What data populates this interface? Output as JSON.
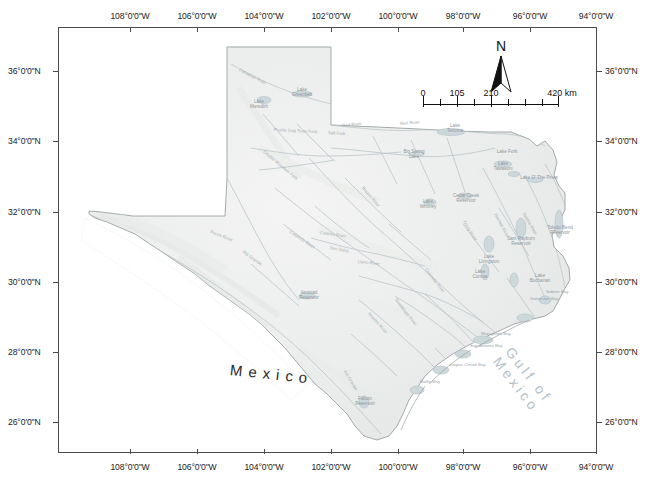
{
  "map": {
    "title": "Texas rivers, reservoirs and bays reference map",
    "frame": {
      "left": 58,
      "top": 27,
      "width": 539,
      "height": 426
    },
    "colors": {
      "land_fill": "#eceeed",
      "land_outline": "#8f9795",
      "frame": "#4b4b4b",
      "water": "#b9c6cd",
      "label_text": "#9aa0a2",
      "gulf_label": "#b4c2c9",
      "mexico_label": "#2b2b2b",
      "background": "#ffffff"
    },
    "graticule": {
      "lon_labels": [
        "108°0'0\"W",
        "106°0'0\"W",
        "104°0'0\"W",
        "102°0'0\"W",
        "100°0'0\"W",
        "98°0'0\"W",
        "96°0'0\"W",
        "94°0'0\"W"
      ],
      "lon_values": [
        -108,
        -106,
        -104,
        -102,
        -100,
        -98,
        -96,
        -94
      ],
      "lat_labels": [
        "36°0'0\"N",
        "34°0'0\"N",
        "32°0'0\"N",
        "30°0'0\"N",
        "28°0'0\"N",
        "26°0'0\"N"
      ],
      "lat_values": [
        36,
        34,
        32,
        30,
        28,
        26
      ]
    },
    "north_arrow": {
      "label": "N",
      "icon": "north-arrow-icon"
    },
    "scale_bar": {
      "unit_label": "420 km",
      "ticks": [
        "0",
        "105",
        "210",
        "420 km"
      ],
      "tick_values": [
        0,
        105,
        210,
        420
      ],
      "segments": 8
    },
    "region_labels": [
      {
        "name": "mexico-label",
        "text": "Mexico"
      },
      {
        "name": "gulf-of-mexico-label",
        "text": "Gulf of Mexico"
      }
    ],
    "reservoir_labels": [
      {
        "text": "Lake\nMeredith",
        "x": 253,
        "top": 80
      },
      {
        "text": "Lake\nGreenbelt",
        "x": 292,
        "top": 72
      },
      {
        "text": "Lake\nTexoma",
        "x": 452,
        "top": 127
      },
      {
        "text": "Lake\nTawakoni",
        "x": 500,
        "top": 166
      },
      {
        "text": "Lake O' The Pines",
        "x": 535,
        "top": 172
      },
      {
        "text": "Lake Fork",
        "x": 504,
        "top": 157
      },
      {
        "text": "Big Spring\nLake",
        "x": 412,
        "top": 153
      },
      {
        "text": "Lake\nWhitney",
        "x": 425,
        "top": 203
      },
      {
        "text": "Cedar Creek\nReservoir",
        "x": 464,
        "top": 196
      },
      {
        "text": "Lake\nLivingston",
        "x": 487,
        "top": 257
      },
      {
        "text": "Sam Rayburn\nReservoir",
        "x": 519,
        "top": 239
      },
      {
        "text": "Toledo Bend\nReservoir",
        "x": 558,
        "top": 228
      },
      {
        "text": "Lake\nConroe",
        "x": 478,
        "top": 272
      },
      {
        "text": "Lake\nBuchanan",
        "x": 538,
        "top": 276
      },
      {
        "text": "Amistad\nReservoir",
        "x": 307,
        "top": 293
      },
      {
        "text": "Falcon\nReservoir",
        "x": 363,
        "top": 399
      }
    ],
    "bay_labels": [
      {
        "text": "Sabine Bay",
        "x": 544,
        "top": 292
      },
      {
        "text": "Galveston Bay",
        "x": 528,
        "top": 299
      },
      {
        "text": "Matagorda Bay",
        "x": 479,
        "top": 334
      },
      {
        "text": "San Antonio Bay",
        "x": 468,
        "top": 346
      },
      {
        "text": "Corpus Christi Bay",
        "x": 447,
        "top": 365
      },
      {
        "text": "Baffin Bay",
        "x": 418,
        "top": 382
      }
    ],
    "river_labels": [
      {
        "text": "Canadian River",
        "x": 238,
        "top": 70,
        "rot": 62
      },
      {
        "text": "Red River",
        "x": 340,
        "top": 126,
        "rot": -10
      },
      {
        "text": "Red River",
        "x": 398,
        "top": 124,
        "rot": -8
      },
      {
        "text": "Prairie Dog Town Fork",
        "x": 292,
        "top": 127,
        "rot": 4
      },
      {
        "text": "Salt Fork",
        "x": 326,
        "top": 130,
        "rot": 6
      },
      {
        "text": "Double Mountain Fork",
        "x": 270,
        "top": 152,
        "rot": 55
      },
      {
        "text": "Brazos River",
        "x": 372,
        "top": 188,
        "rot": 56
      },
      {
        "text": "Colorado River",
        "x": 300,
        "top": 232,
        "rot": 38
      },
      {
        "text": "Pecos River",
        "x": 215,
        "top": 232,
        "rot": 22
      },
      {
        "text": "Rio Grande",
        "x": 248,
        "top": 252,
        "rot": 38
      },
      {
        "text": "Concho River",
        "x": 323,
        "top": 233,
        "rot": 10
      },
      {
        "text": "Llano River",
        "x": 360,
        "top": 262,
        "rot": 8
      },
      {
        "text": "Guadalupe River",
        "x": 398,
        "top": 300,
        "rot": 58
      },
      {
        "text": "Nueces River",
        "x": 372,
        "top": 314,
        "rot": 52
      },
      {
        "text": "Trinity River",
        "x": 466,
        "top": 222,
        "rot": 62
      },
      {
        "text": "Neches River",
        "x": 497,
        "top": 215,
        "rot": 66
      },
      {
        "text": "Sabine River",
        "x": 524,
        "top": 214,
        "rot": 64
      },
      {
        "text": "Rio Grande",
        "x": 346,
        "top": 372,
        "rot": 62
      },
      {
        "text": "Colorado River",
        "x": 428,
        "top": 270,
        "rot": 56
      },
      {
        "text": "San Saba",
        "x": 332,
        "top": 248,
        "rot": 12
      }
    ]
  }
}
